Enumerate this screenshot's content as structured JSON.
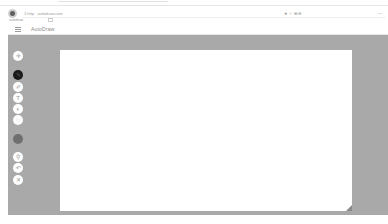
{
  "browser": {
    "address_text": "1 http · autodraw.com",
    "address_right": "★ ☆ ⊞ ⊟",
    "address_end": "⋯",
    "bookmark_label": "autodraw"
  },
  "app": {
    "title": "AutoDraw",
    "menu_icon": "hamburger-icon"
  },
  "toolbar": {
    "tools": [
      {
        "name": "select",
        "icon": "move-icon",
        "glyph": "✛"
      },
      {
        "name": "autodraw",
        "icon": "autodraw-icon",
        "glyph": "✎"
      },
      {
        "name": "draw",
        "icon": "pencil-icon",
        "glyph": "✐"
      },
      {
        "name": "type",
        "icon": "text-icon",
        "glyph": "T"
      },
      {
        "name": "fill",
        "icon": "fill-icon",
        "glyph": "◐"
      },
      {
        "name": "shape",
        "icon": "shape-icon",
        "glyph": "◌"
      },
      {
        "name": "color",
        "icon": "color-swatch-icon",
        "glyph": ""
      },
      {
        "name": "zoom",
        "icon": "zoom-icon",
        "glyph": "⚲"
      },
      {
        "name": "undo",
        "icon": "undo-icon",
        "glyph": "↶"
      },
      {
        "name": "delete",
        "icon": "delete-icon",
        "glyph": "✕"
      }
    ],
    "accent_colors": {
      "active_tool": "#1a1a1a",
      "color_swatch": "#6f6f6f",
      "background": "#a9a9a9"
    }
  }
}
